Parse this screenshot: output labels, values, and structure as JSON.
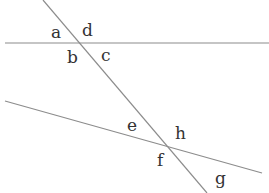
{
  "diagram": {
    "colors": {
      "line": "#8c8c8c",
      "label": "#333333",
      "background": "#ffffff"
    },
    "lines": [
      {
        "id": "upper-line",
        "x1": 5,
        "y1": 43,
        "x2": 269,
        "y2": 43
      },
      {
        "id": "lower-line",
        "x1": 5,
        "y1": 101,
        "x2": 262,
        "y2": 173
      },
      {
        "id": "transversal",
        "x1": 43,
        "y1": 0,
        "x2": 207,
        "y2": 193
      }
    ],
    "angle_labels": [
      {
        "text": "a",
        "x": 51,
        "y": 24
      },
      {
        "text": "d",
        "x": 82,
        "y": 22
      },
      {
        "text": "b",
        "x": 67,
        "y": 49
      },
      {
        "text": "c",
        "x": 101,
        "y": 47
      },
      {
        "text": "e",
        "x": 127,
        "y": 117
      },
      {
        "text": "h",
        "x": 175,
        "y": 125
      },
      {
        "text": "f",
        "x": 157,
        "y": 152
      },
      {
        "text": "g",
        "x": 215,
        "y": 170
      }
    ]
  }
}
